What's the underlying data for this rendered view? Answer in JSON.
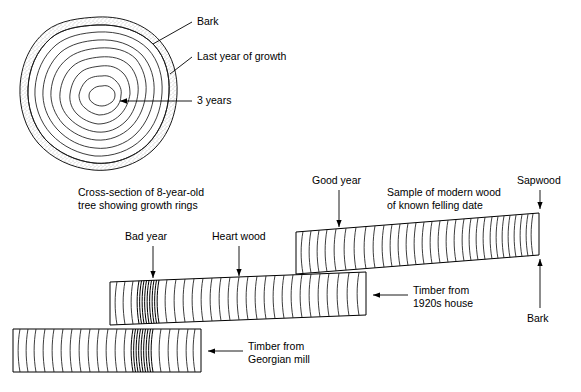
{
  "figure": {
    "background_color": "#ffffff",
    "line_color": "#000000"
  },
  "cross_section": {
    "caption_line1": "Cross-section of 8-year-old",
    "caption_line2": "tree showing growth rings",
    "ring_count": 8,
    "labels": [
      {
        "id": "bark",
        "text": "Bark"
      },
      {
        "id": "last-year-of-growth",
        "text": "Last year of growth"
      },
      {
        "id": "three-years",
        "text": "3 years"
      }
    ]
  },
  "samples": [
    {
      "id": "modern-wood",
      "title_line1": "Sample of modern wood",
      "title_line2": "of known felling date",
      "callouts": [
        {
          "id": "good-year",
          "text": "Good year"
        },
        {
          "id": "sapwood",
          "text": "Sapwood"
        },
        {
          "id": "bark",
          "text": "Bark"
        }
      ]
    },
    {
      "id": "1920s-house",
      "title_line1": "Timber from",
      "title_line2": "1920s house",
      "callouts": [
        {
          "id": "bad-year",
          "text": "Bad year"
        },
        {
          "id": "heart-wood",
          "text": "Heart wood"
        }
      ]
    },
    {
      "id": "georgian-mill",
      "title_line1": "Timber from",
      "title_line2": "Georgian mill",
      "callouts": []
    }
  ]
}
